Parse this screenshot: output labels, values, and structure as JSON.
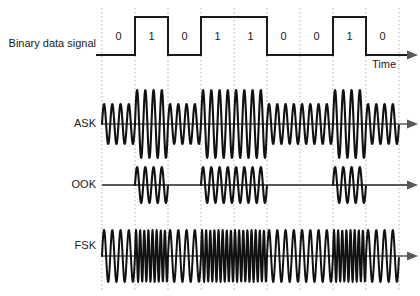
{
  "figure": {
    "background": "#ffffff",
    "width": 420,
    "height": 296
  },
  "labels": {
    "binary": "Binary data signal",
    "ask": "ASK",
    "ook": "OOK",
    "fsk": "FSK",
    "time_axis": "Time"
  },
  "chart_data": {
    "type": "line",
    "xlabel": "Time",
    "ylabel": "",
    "grid": true,
    "legend_position": "left-labels",
    "bits": [
      0,
      1,
      0,
      1,
      1,
      0,
      0,
      1,
      0
    ],
    "bit_labels": [
      "0",
      "1",
      "0",
      "1",
      "1",
      "0",
      "0",
      "1",
      "0"
    ],
    "bit_count": 9,
    "plot_x_start": 102,
    "plot_x_end": 399,
    "bit_width_px": 33,
    "gridline_x": [
      102,
      135,
      168,
      201,
      234,
      267,
      300,
      333,
      366,
      399
    ],
    "colors": {
      "waveform": "#111111",
      "axis": "#595959",
      "gridline": "#b0b0b0",
      "text": "#1a1a1a",
      "square_wave": "#1a1a1a"
    },
    "series": [
      {
        "name": "Binary data signal",
        "type": "square",
        "baseline_y": 55,
        "high_y": 17,
        "values": [
          0,
          1,
          0,
          1,
          1,
          0,
          0,
          1,
          0
        ],
        "description": "NRZ square wave; high level for bit 1, low level for bit 0"
      },
      {
        "name": "ASK",
        "type": "amplitude-shift-keying",
        "baseline_y": 124,
        "cycles_per_bit": 4,
        "amplitude_high": 34,
        "amplitude_low": 20,
        "description": "Constant carrier frequency; large amplitude for bit 1, reduced amplitude for bit 0"
      },
      {
        "name": "OOK",
        "type": "on-off-keying",
        "baseline_y": 185,
        "cycles_per_bit": 4,
        "amplitude_high": 18,
        "amplitude_low": 0,
        "description": "Carrier present for bit 1, no carrier (flat line) for bit 0"
      },
      {
        "name": "FSK",
        "type": "frequency-shift-keying",
        "baseline_y": 256,
        "cycles_per_bit_high": 8,
        "cycles_per_bit_low": 4,
        "amplitude": 26,
        "description": "Constant amplitude; higher carrier frequency for bit 1, lower frequency for bit 0"
      }
    ]
  }
}
